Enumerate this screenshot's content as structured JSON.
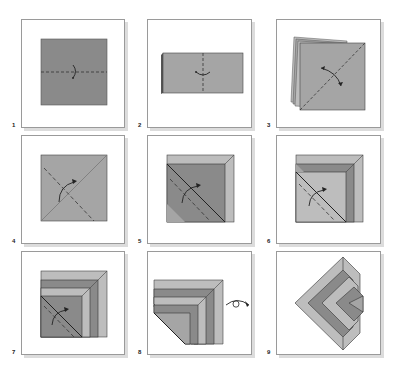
{
  "colors": {
    "dark": "#8a8a8a",
    "mid": "#a5a5a5",
    "light": "#bdbdbd",
    "outline": "#333333",
    "panel_border": "#9a9a9a"
  },
  "steps": [
    {
      "number": "1",
      "description": "Valley fold square in half horizontally"
    },
    {
      "number": "2",
      "description": "Fold rectangle in half vertically"
    },
    {
      "number": "3",
      "description": "Fold and unfold along diagonal"
    },
    {
      "number": "4",
      "description": "Fold corner along dashed line"
    },
    {
      "number": "5",
      "description": "Fold next layer along dashed line"
    },
    {
      "number": "6",
      "description": "Fold next layer along dashed line"
    },
    {
      "number": "7",
      "description": "Fold last layer along dashed line"
    },
    {
      "number": "8",
      "description": "Turn model over"
    },
    {
      "number": "9",
      "description": "Finished model"
    }
  ]
}
